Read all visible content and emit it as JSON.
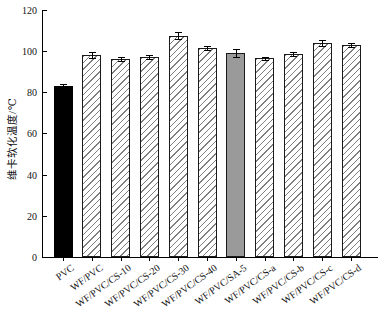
{
  "chart_data": {
    "type": "bar",
    "title": "",
    "xlabel": "",
    "ylabel": "维卡软化温度/℃",
    "ylim": [
      0,
      120
    ],
    "yticks": [
      0,
      20,
      40,
      60,
      80,
      100,
      120
    ],
    "grid": false,
    "legend": null,
    "categories": [
      "PVC",
      "WF/PVC",
      "WF/PVC/CS-10",
      "WF/PVC/CS-20",
      "WF/PVC/CS-30",
      "WF/PVC/CS-40",
      "WF/PVC/SA-5",
      "WF/PVC/CS-a",
      "WF/PVC/CS-b",
      "WF/PVC/CS-c",
      "WF/PVC/CS-d"
    ],
    "values": [
      83,
      98,
      96,
      97,
      107.5,
      101.5,
      99,
      96.5,
      98.5,
      104,
      103
    ],
    "errors": [
      1,
      1.5,
      1,
      1,
      1.5,
      1,
      2,
      0.8,
      1,
      1.5,
      1
    ],
    "bar_styles": [
      "solid-black",
      "hatch",
      "hatch",
      "hatch",
      "hatch",
      "hatch",
      "solid-gray",
      "hatch",
      "hatch",
      "hatch",
      "hatch"
    ],
    "colors": {
      "solid_black": "#000000",
      "solid_gray": "#9a9a9a",
      "hatch_line": "#808080",
      "bar_border": "#1a1a1a",
      "axis": "#000000",
      "background": "#ffffff"
    }
  }
}
